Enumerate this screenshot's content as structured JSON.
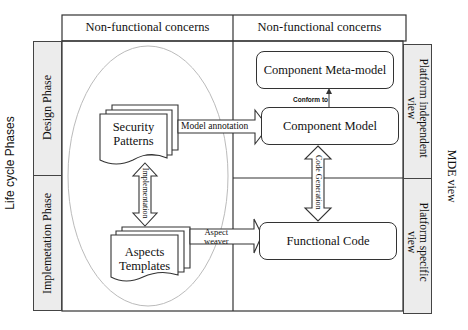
{
  "diagram": {
    "column_headers": {
      "left": "Non-functional concerns",
      "right": "Non-functional concerns"
    },
    "left_axis": {
      "title": "Life cycle Phases",
      "phases": [
        "Design Phase",
        "Implemetation Phase"
      ]
    },
    "right_axis": {
      "title": "MDE view",
      "views": [
        {
          "line1": "Platform independent",
          "line2": "view"
        },
        {
          "line1": "Platform specific",
          "line2": "view"
        }
      ]
    },
    "artifacts": {
      "security_patterns": {
        "line1": "Security",
        "line2": "Patterns"
      },
      "aspects_templates": {
        "line1": "Aspects",
        "line2": "Templates"
      }
    },
    "boxes": {
      "meta_model": "Component Meta-model",
      "component_model": "Component Model",
      "functional_code": "Functional Code"
    },
    "relations": {
      "model_annotation": "Model annotation",
      "conform_to": "Conform to",
      "implementation": "Implementation",
      "code_generation": "Code Generation",
      "aspect_weaver_line1": "Aspect",
      "aspect_weaver_line2": "weaver"
    },
    "colors": {
      "band_fill": "#ececec",
      "line": "#333333",
      "ellipse": "#bbbbbb"
    }
  }
}
